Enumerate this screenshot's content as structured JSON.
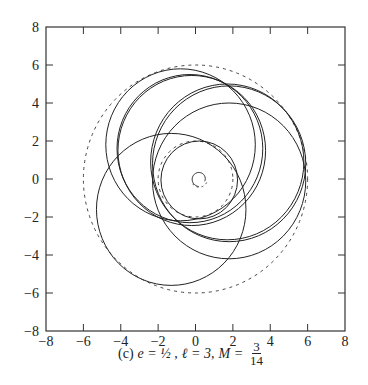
{
  "chart_data": {
    "type": "line",
    "title": "",
    "caption": {
      "label": "(c)",
      "e": "e = ½ ,",
      "l": "ℓ = 3,",
      "m_prefix": "M =",
      "m_num": "3",
      "m_den": "14"
    },
    "xlabel": "",
    "ylabel": "",
    "xlim": [
      -8,
      8
    ],
    "ylim": [
      -8,
      8
    ],
    "x_ticks": [
      "-8",
      "-6",
      "-4",
      "-2",
      "0",
      "2",
      "4",
      "6",
      "8"
    ],
    "y_ticks": [
      "8",
      "6",
      "4",
      "2",
      "0",
      "-2",
      "-4",
      "-6",
      "-8"
    ],
    "grid": false,
    "legend": null,
    "series": [
      {
        "name": "outer-bound",
        "style": "dashed",
        "shape": "circle",
        "center": [
          0,
          0
        ],
        "radius": 6
      },
      {
        "name": "inner-bound",
        "style": "dashed",
        "shape": "circle",
        "center": [
          0,
          0
        ],
        "radius": 2
      },
      {
        "name": "orbit-loop-1",
        "style": "solid",
        "shape": "circle",
        "center": [
          -0.8,
          1.8
        ],
        "radius": 4
      },
      {
        "name": "orbit-loop-2",
        "style": "solid",
        "shape": "circle",
        "center": [
          -1.3,
          -1.6
        ],
        "radius": 4
      },
      {
        "name": "orbit-loop-3",
        "style": "solid",
        "shape": "circle",
        "center": [
          1.8,
          -0.1
        ],
        "radius": 4.1
      },
      {
        "name": "orbit-loop-4a",
        "style": "solid",
        "shape": "circle",
        "center": [
          -0.3,
          1.6
        ],
        "radius": 3.9
      },
      {
        "name": "orbit-loop-4b",
        "style": "solid",
        "shape": "circle",
        "center": [
          -0.2,
          1.5
        ],
        "radius": 3.95
      },
      {
        "name": "orbit-loop-5a",
        "style": "solid",
        "shape": "circle",
        "center": [
          1.7,
          0.9
        ],
        "radius": 4.1
      },
      {
        "name": "orbit-loop-5b",
        "style": "solid",
        "shape": "circle",
        "center": [
          1.8,
          0.8
        ],
        "radius": 4.1
      },
      {
        "name": "orbit-loop-6",
        "style": "solid",
        "shape": "circle",
        "center": [
          0.2,
          -0.05
        ],
        "radius": 2.05
      },
      {
        "name": "central-spiral",
        "style": "solid+dashed",
        "shape": "spiral",
        "center": [
          0.2,
          0
        ],
        "radius": 0.35
      }
    ]
  }
}
